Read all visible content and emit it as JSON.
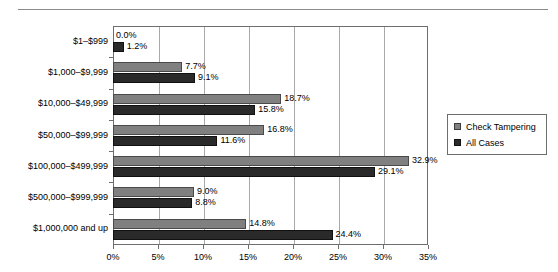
{
  "chart_data": {
    "type": "bar",
    "orientation": "horizontal",
    "title": "",
    "xlabel": "",
    "ylabel": "",
    "xlim": [
      0,
      35
    ],
    "xticks": [
      "0%",
      "5%",
      "10%",
      "15%",
      "20%",
      "25%",
      "30%",
      "35%"
    ],
    "xtick_values": [
      0,
      5,
      10,
      15,
      20,
      25,
      30,
      35
    ],
    "grid": true,
    "grid_axis": "x",
    "legend_position": "right",
    "categories": [
      "$1–$999",
      "$1,000–$9,999",
      "$10,000–$49,999",
      "$50,000–$99,999",
      "$100,000–$499,999",
      "$500,000–$999,999",
      "$1,000,000 and up"
    ],
    "series": [
      {
        "name": "Check Tampering",
        "color": "#808080",
        "values": [
          0.0,
          7.7,
          18.7,
          16.8,
          32.9,
          9.0,
          14.8
        ],
        "labels": [
          "0.0%",
          "7.7%",
          "18.7%",
          "16.8%",
          "32.9%",
          "9.0%",
          "14.8%"
        ]
      },
      {
        "name": "All Cases",
        "color": "#2a2a2a",
        "values": [
          1.2,
          9.1,
          15.8,
          11.6,
          29.1,
          8.8,
          24.4
        ],
        "labels": [
          "1.2%",
          "9.1%",
          "15.8%",
          "11.6%",
          "29.1%",
          "8.8%",
          "24.4%"
        ]
      }
    ]
  },
  "legend": {
    "items": [
      {
        "label": "Check Tampering"
      },
      {
        "label": "All Cases"
      }
    ]
  },
  "header": {
    "cropped_title": ""
  }
}
